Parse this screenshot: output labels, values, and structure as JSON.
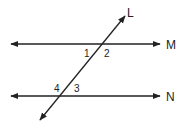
{
  "diagram": {
    "type": "parallel-lines-transversal",
    "lines": {
      "transversal": {
        "label": "L"
      },
      "upper_parallel": {
        "label": "M"
      },
      "lower_parallel": {
        "label": "N"
      }
    },
    "angles": [
      {
        "label": "1",
        "position": "upper-left at L∩M (below M, left of L)"
      },
      {
        "label": "2",
        "position": "lower-right at L∩M (below M, right of L)"
      },
      {
        "label": "3",
        "position": "upper-right at L∩N (above N, right of L)"
      },
      {
        "label": "4",
        "position": "upper-left at L∩N (above N, left of L)"
      }
    ],
    "colors": {
      "line": "#222222",
      "background": "#ffffff"
    }
  }
}
